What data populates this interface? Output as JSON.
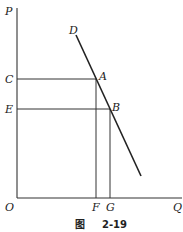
{
  "diagram": {
    "type": "demand-curve",
    "axes": {
      "y_label": "P",
      "x_label": "Q",
      "origin_label": "O"
    },
    "curve": {
      "label": "D"
    },
    "points": [
      {
        "label": "A",
        "price_label": "C",
        "quantity_label": "F"
      },
      {
        "label": "B",
        "price_label": "E",
        "quantity_label": "G"
      }
    ]
  },
  "caption": {
    "prefix": "图",
    "number": "2-19"
  }
}
